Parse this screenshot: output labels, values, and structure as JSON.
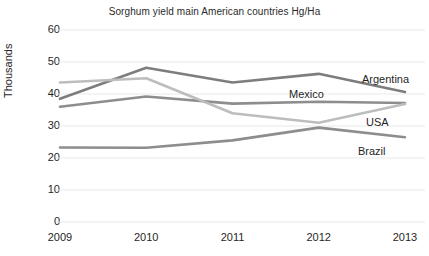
{
  "chart_data": {
    "type": "line",
    "title": "Sorghum yield main American countries Hg/Ha",
    "xlabel": "",
    "ylabel": "Thousands",
    "categories": [
      "2009",
      "2010",
      "2011",
      "2012",
      "2013"
    ],
    "ylim": [
      0,
      60
    ],
    "yticks": [
      60,
      50,
      40,
      30,
      20,
      10,
      0
    ],
    "grid": true,
    "legend_position": "right-inline-labels",
    "series": [
      {
        "name": "Argentina",
        "color": "#7d7d7d",
        "values": [
          38.5,
          48.2,
          43.6,
          46.3,
          40.6
        ]
      },
      {
        "name": "Mexico",
        "color": "#8d8d8d",
        "values": [
          36.0,
          39.2,
          37.0,
          37.6,
          37.2
        ]
      },
      {
        "name": "USA",
        "color": "#bdbdbd",
        "values": [
          43.6,
          44.9,
          34.0,
          31.0,
          36.9
        ]
      },
      {
        "name": "Brazil",
        "color": "#8d8d8d",
        "values": [
          23.3,
          23.2,
          25.5,
          29.5,
          26.5
        ]
      }
    ],
    "annotations": [
      {
        "text": "Argentina",
        "x": 362,
        "y": 73
      },
      {
        "text": "Mexico",
        "x": 289,
        "y": 88
      },
      {
        "text": "USA",
        "x": 366,
        "y": 116
      },
      {
        "text": "Brazil",
        "x": 358,
        "y": 145
      }
    ],
    "colors": {
      "grid": "#e9e9e9",
      "axis_text": "#1f1f1f",
      "title_text": "#2b2b2b",
      "background": "#ffffff"
    }
  }
}
